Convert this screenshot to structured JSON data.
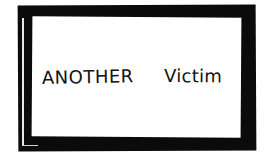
{
  "card": {
    "text": "Another Victim",
    "words": [
      "ANOTHER",
      "Victim"
    ],
    "frame_color": "#0b0b0b",
    "background_color": "#ffffff",
    "ink_color": "#111111"
  }
}
